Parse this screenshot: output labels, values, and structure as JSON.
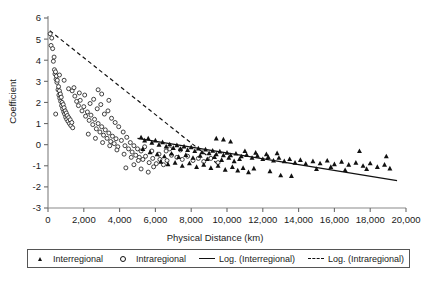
{
  "chart_data": {
    "type": "scatter",
    "title": "",
    "xlabel": "Physical Distance (km)",
    "ylabel": "Coefficient",
    "xlim": [
      0,
      20000
    ],
    "ylim": [
      -3,
      6
    ],
    "xticks": [
      0,
      2000,
      4000,
      6000,
      8000,
      10000,
      12000,
      14000,
      16000,
      18000,
      20000
    ],
    "xticklabels": [
      "0",
      "2,000",
      "4,000",
      "6,000",
      "8,000",
      "10,000",
      "12,000",
      "14,000",
      "16,000",
      "18,000",
      "20,000"
    ],
    "yticks": [
      -3,
      -2,
      -1,
      0,
      1,
      2,
      3,
      4,
      5,
      6
    ],
    "yticklabels": [
      "-3",
      "-2",
      "-1",
      "0",
      "1",
      "2",
      "3",
      "4",
      "5",
      "6"
    ],
    "grid": false,
    "legend_position": "below-axis",
    "legend": [
      {
        "label": "Interregional",
        "marker": "filled-triangle",
        "color": "#111111"
      },
      {
        "label": "Intraregional",
        "marker": "open-circle",
        "color": "#111111"
      },
      {
        "label": "Log. (Interregional)",
        "marker": "solid-line",
        "color": "#111111"
      },
      {
        "label": "Log. (Intraregional)",
        "marker": "dashed-line",
        "color": "#111111"
      }
    ],
    "series": [
      {
        "name": "Intraregional",
        "marker": "open-circle",
        "points": [
          [
            120,
            5.25
          ],
          [
            170,
            4.7
          ],
          [
            210,
            5.05
          ],
          [
            260,
            4.55
          ],
          [
            300,
            3.95
          ],
          [
            340,
            4.15
          ],
          [
            360,
            3.55
          ],
          [
            390,
            3.35
          ],
          [
            420,
            3.45
          ],
          [
            450,
            3.1
          ],
          [
            470,
            3.25
          ],
          [
            500,
            2.95
          ],
          [
            520,
            3.05
          ],
          [
            560,
            2.6
          ],
          [
            590,
            2.75
          ],
          [
            610,
            2.35
          ],
          [
            640,
            2.55
          ],
          [
            660,
            2.2
          ],
          [
            690,
            2.4
          ],
          [
            710,
            2.05
          ],
          [
            740,
            2.25
          ],
          [
            760,
            1.85
          ],
          [
            790,
            2.0
          ],
          [
            820,
            1.7
          ],
          [
            850,
            1.9
          ],
          [
            880,
            1.55
          ],
          [
            900,
            1.75
          ],
          [
            930,
            1.45
          ],
          [
            960,
            1.6
          ],
          [
            990,
            1.3
          ],
          [
            1020,
            1.5
          ],
          [
            1050,
            1.2
          ],
          [
            1080,
            1.38
          ],
          [
            1120,
            1.1
          ],
          [
            1160,
            1.28
          ],
          [
            1200,
            1.0
          ],
          [
            1240,
            1.18
          ],
          [
            1280,
            0.9
          ],
          [
            1330,
            1.05
          ],
          [
            1380,
            0.8
          ],
          [
            430,
            1.45
          ],
          [
            640,
            3.3
          ],
          [
            900,
            3.05
          ],
          [
            1150,
            2.65
          ],
          [
            1350,
            2.55
          ],
          [
            1500,
            2.3
          ],
          [
            1600,
            2.05
          ],
          [
            1700,
            1.85
          ],
          [
            1800,
            2.1
          ],
          [
            1900,
            1.6
          ],
          [
            2000,
            1.8
          ],
          [
            2100,
            1.35
          ],
          [
            2200,
            1.55
          ],
          [
            2300,
            1.15
          ],
          [
            2400,
            1.4
          ],
          [
            2500,
            0.95
          ],
          [
            2600,
            1.2
          ],
          [
            2700,
            0.75
          ],
          [
            2800,
            1.0
          ],
          [
            2900,
            0.6
          ],
          [
            3000,
            0.85
          ],
          [
            3100,
            0.45
          ],
          [
            3200,
            0.7
          ],
          [
            3300,
            0.3
          ],
          [
            3400,
            0.55
          ],
          [
            3500,
            0.15
          ],
          [
            3600,
            0.4
          ],
          [
            3700,
            0.05
          ],
          [
            3800,
            0.28
          ],
          [
            3900,
            -0.1
          ],
          [
            1450,
            2.7
          ],
          [
            1750,
            2.45
          ],
          [
            2050,
            2.35
          ],
          [
            2350,
            1.95
          ],
          [
            2550,
            2.15
          ],
          [
            2750,
            1.7
          ],
          [
            2950,
            1.9
          ],
          [
            3150,
            1.45
          ],
          [
            3350,
            1.6
          ],
          [
            3550,
            1.25
          ],
          [
            3750,
            1.05
          ],
          [
            3950,
            0.85
          ],
          [
            4100,
            0.2
          ],
          [
            4200,
            0.6
          ],
          [
            4300,
            -0.05
          ],
          [
            4400,
            0.35
          ],
          [
            4500,
            -0.2
          ],
          [
            4600,
            0.1
          ],
          [
            4700,
            -0.35
          ],
          [
            4800,
            -0.05
          ],
          [
            4900,
            -0.5
          ],
          [
            5000,
            -0.2
          ],
          [
            5100,
            -0.6
          ],
          [
            5200,
            -0.3
          ],
          [
            5300,
            -0.7
          ],
          [
            2250,
            0.5
          ],
          [
            2650,
            0.3
          ],
          [
            3050,
            0.1
          ],
          [
            3450,
            -0.05
          ],
          [
            3850,
            -0.25
          ],
          [
            4250,
            -0.45
          ],
          [
            4650,
            -0.6
          ],
          [
            5050,
            -0.75
          ],
          [
            5450,
            -0.55
          ],
          [
            5650,
            -0.85
          ],
          [
            5850,
            -0.65
          ],
          [
            6050,
            -0.9
          ],
          [
            6250,
            -0.7
          ],
          [
            6450,
            -0.95
          ],
          [
            6650,
            -0.75
          ],
          [
            4350,
            -1.1
          ],
          [
            4800,
            -0.95
          ],
          [
            5200,
            -1.15
          ],
          [
            5600,
            -1.3
          ],
          [
            5900,
            -1.05
          ],
          [
            5400,
            -0.1
          ],
          [
            5800,
            -0.3
          ],
          [
            6200,
            -0.45
          ],
          [
            6600,
            -0.3
          ],
          [
            6900,
            -0.5
          ],
          [
            7200,
            -0.6
          ],
          [
            7500,
            -0.7
          ],
          [
            7800,
            -0.55
          ],
          [
            8100,
            -0.75
          ],
          [
            8400,
            -0.65
          ],
          [
            8700,
            -0.8
          ],
          [
            9100,
            -0.65
          ],
          [
            9500,
            -0.85
          ],
          [
            6800,
            -0.2
          ],
          [
            7400,
            -0.25
          ],
          [
            3000,
            2.4
          ],
          [
            3400,
            2.1
          ],
          [
            2800,
            2.6
          ]
        ]
      },
      {
        "name": "Interregional",
        "marker": "filled-triangle",
        "points": [
          [
            5200,
            0.35
          ],
          [
            5400,
            0.2
          ],
          [
            5600,
            0.3
          ],
          [
            5800,
            0.1
          ],
          [
            6000,
            0.2
          ],
          [
            6200,
            0.0
          ],
          [
            6400,
            0.12
          ],
          [
            6600,
            -0.08
          ],
          [
            6800,
            0.02
          ],
          [
            7000,
            -0.15
          ],
          [
            7200,
            -0.02
          ],
          [
            7400,
            -0.2
          ],
          [
            7600,
            -0.08
          ],
          [
            7800,
            -0.25
          ],
          [
            8000,
            -0.12
          ],
          [
            8200,
            -0.3
          ],
          [
            8400,
            -0.18
          ],
          [
            8600,
            -0.35
          ],
          [
            8800,
            -0.22
          ],
          [
            9000,
            -0.4
          ],
          [
            9200,
            -0.28
          ],
          [
            9400,
            -0.45
          ],
          [
            9600,
            -0.32
          ],
          [
            9800,
            -0.5
          ],
          [
            10000,
            -0.38
          ],
          [
            5300,
            -0.2
          ],
          [
            5700,
            -0.35
          ],
          [
            6100,
            -0.45
          ],
          [
            6500,
            -0.55
          ],
          [
            6900,
            -0.42
          ],
          [
            7300,
            -0.58
          ],
          [
            7700,
            -0.48
          ],
          [
            8100,
            -0.62
          ],
          [
            8500,
            -0.52
          ],
          [
            8900,
            -0.68
          ],
          [
            9300,
            -0.58
          ],
          [
            9700,
            -0.72
          ],
          [
            10100,
            -0.62
          ],
          [
            10400,
            -0.78
          ],
          [
            10700,
            -0.68
          ],
          [
            6300,
            -0.8
          ],
          [
            6700,
            -0.92
          ],
          [
            7100,
            -0.85
          ],
          [
            7500,
            -1.0
          ],
          [
            7900,
            -0.88
          ],
          [
            8300,
            -1.05
          ],
          [
            8700,
            -0.95
          ],
          [
            9100,
            -1.1
          ],
          [
            9500,
            -1.0
          ],
          [
            9900,
            -1.18
          ],
          [
            10300,
            -1.05
          ],
          [
            10600,
            -1.22
          ],
          [
            10900,
            -1.1
          ],
          [
            11200,
            -1.3
          ],
          [
            11500,
            -1.12
          ],
          [
            10200,
            -0.5
          ],
          [
            10500,
            -0.42
          ],
          [
            10800,
            -0.55
          ],
          [
            11100,
            -0.48
          ],
          [
            11400,
            -0.62
          ],
          [
            11700,
            -0.52
          ],
          [
            12000,
            -0.68
          ],
          [
            12300,
            -0.58
          ],
          [
            12600,
            -0.75
          ],
          [
            12900,
            -0.62
          ],
          [
            11000,
            -0.3
          ],
          [
            11600,
            -0.38
          ],
          [
            12200,
            -0.45
          ],
          [
            12800,
            -0.4
          ],
          [
            13200,
            -0.78
          ],
          [
            13500,
            -0.68
          ],
          [
            13800,
            -0.85
          ],
          [
            14100,
            -0.72
          ],
          [
            14400,
            -0.9
          ],
          [
            13000,
            -1.45
          ],
          [
            13600,
            -1.48
          ],
          [
            12400,
            -1.25
          ],
          [
            14800,
            -0.78
          ],
          [
            15200,
            -0.88
          ],
          [
            15600,
            -0.75
          ],
          [
            16000,
            -0.92
          ],
          [
            16400,
            -0.8
          ],
          [
            16800,
            -0.95
          ],
          [
            17200,
            -0.85
          ],
          [
            17600,
            -1.0
          ],
          [
            18000,
            -0.88
          ],
          [
            18400,
            -1.05
          ],
          [
            18800,
            -0.95
          ],
          [
            19100,
            -1.12
          ],
          [
            17400,
            -0.3
          ],
          [
            18900,
            -0.55
          ],
          [
            15000,
            -1.15
          ],
          [
            15800,
            -1.05
          ],
          [
            16600,
            -1.2
          ],
          [
            17800,
            -1.15
          ],
          [
            9800,
            0.25
          ],
          [
            10200,
            0.15
          ],
          [
            9400,
            0.3
          ]
        ]
      }
    ],
    "trendlines": [
      {
        "name": "Log. (Interregional)",
        "style": "solid",
        "from": [
          5000,
          0.3
        ],
        "to": [
          19500,
          -1.7
        ]
      },
      {
        "name": "Log. (Intraregional)",
        "style": "dashed",
        "from": [
          100,
          5.4
        ],
        "to": [
          9600,
          -1.0
        ]
      }
    ]
  },
  "caption": {
    "partial_text": ""
  }
}
